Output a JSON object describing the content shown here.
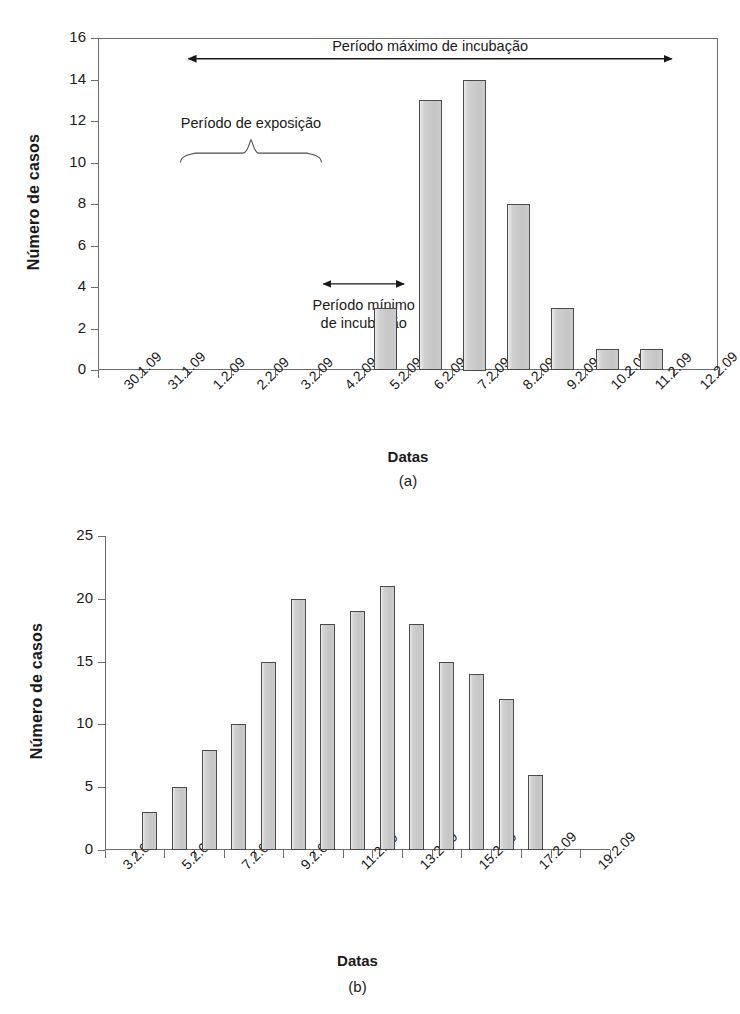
{
  "figure": {
    "panels": [
      {
        "id": "a",
        "panel_label": "(a)",
        "axis_title_y": "Número de casos",
        "axis_title_x": "Datas",
        "annotations": {
          "max_incubation": "Período máximo de incubação",
          "exposure": "Período de exposição",
          "min_incubation_line1": "Período mínimo",
          "min_incubation_line2": "de incubação"
        }
      },
      {
        "id": "b",
        "panel_label": "(b)",
        "axis_title_y": "Número de casos",
        "axis_title_x": "Datas"
      }
    ]
  },
  "chart_data": [
    {
      "type": "bar",
      "panel": "(a)",
      "title": "",
      "xlabel": "Datas",
      "ylabel": "Número de casos",
      "ylim": [
        0,
        16
      ],
      "yticks": [
        0,
        2,
        4,
        6,
        8,
        10,
        12,
        14,
        16
      ],
      "grid": false,
      "legend": null,
      "categories": [
        "30.1.09",
        "31.1.09",
        "1.2.09",
        "2.2.09",
        "3.2.09",
        "4.2.09",
        "5.2.09",
        "6.2.09",
        "7.2.09",
        "8.2.09",
        "9.2.09",
        "10.2.09",
        "11.2.09",
        "12.2.09"
      ],
      "values": [
        0,
        0,
        0,
        0,
        0,
        0,
        3,
        13,
        14,
        8,
        3,
        1,
        1,
        0
      ],
      "annotations": [
        {
          "name": "max-incubation-span",
          "text": "Período máximo de incubação",
          "from": "1.2.09",
          "to": "11.2.09",
          "style": "double-arrow"
        },
        {
          "name": "exposure-span",
          "text": "Período de exposição",
          "from": "1.2.09",
          "to": "3.2.09",
          "style": "brace"
        },
        {
          "name": "min-incubation-span",
          "text": "Período mínimo de incubação",
          "from": "4.2.09",
          "to": "5.2.09",
          "style": "double-arrow"
        }
      ]
    },
    {
      "type": "bar",
      "panel": "(b)",
      "title": "",
      "xlabel": "Datas",
      "ylabel": "Número de casos",
      "ylim": [
        0,
        25
      ],
      "yticks": [
        0,
        5,
        10,
        15,
        20,
        25
      ],
      "grid": false,
      "legend": null,
      "tick_labels": [
        "3.2.09",
        "5.2.09",
        "7.2.09",
        "9.2.09",
        "11.2.09",
        "13.2.09",
        "15.2.09",
        "17.2.09",
        "19.2.09"
      ],
      "categories": [
        "4.2.09",
        "5.2.09",
        "6.2.09",
        "7.2.09",
        "8.2.09",
        "9.2.09",
        "10.2.09",
        "11.2.09",
        "12.2.09",
        "13.2.09",
        "14.2.09",
        "15.2.09",
        "16.2.09"
      ],
      "values": [
        3,
        5,
        8,
        10,
        15,
        20,
        18,
        19,
        21,
        18,
        15,
        14,
        12,
        6
      ]
    }
  ],
  "colors": {
    "bar_fill": "#d0d0d0",
    "bar_stroke": "#4a4a4a",
    "axis": "#6d6d6d",
    "text": "#1a1a1a"
  }
}
